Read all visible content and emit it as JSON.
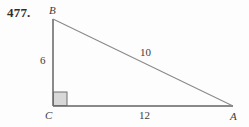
{
  "figure": {
    "problem_number": "477.",
    "background_color": "#fdfdfd",
    "line_color": "#8a8a8a",
    "right_angle_fill": "#d8d8d8",
    "right_angle_stroke": "#6e6e6e",
    "text_color": "#3c3c3c"
  },
  "vertices": {
    "b": "B",
    "c": "C",
    "a": "A"
  },
  "measures": {
    "leg_vertical": "6",
    "hypotenuse": "10",
    "leg_horizontal": "12"
  },
  "geometry": {
    "points": {
      "b": {
        "x": 53,
        "y": 19
      },
      "c": {
        "x": 53,
        "y": 106
      },
      "a": {
        "x": 233,
        "y": 106
      }
    },
    "right_angle_marker": {
      "x": 53,
      "y": 92,
      "size": 14
    }
  }
}
